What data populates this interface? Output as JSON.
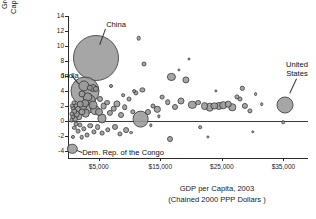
{
  "chart_data": {
    "type": "scatter",
    "title": "",
    "xlabel": "GDP per Capita, 2003 (Chained 2000 PPP Dollars )",
    "xlabel_line1": "GDP per Capita, 2003",
    "xlabel_line2": "(Chained 2000 PPP Dollars )",
    "ylabel": "Growth of Real GDP per Capita, Average 1980-2003 (Percent per Year)",
    "ylabel_line1": "Growth of Real GDP per",
    "ylabel_line2": "Capita, Average 1980-2003",
    "ylabel_line3": "(Percent per Year)",
    "xlim": [
      0,
      39000
    ],
    "ylim": [
      -5,
      14
    ],
    "xticks": [
      5000,
      15000,
      25000,
      35000
    ],
    "xtick_labels": [
      "$5,000",
      "$15,000",
      "$25,000",
      "$35,000"
    ],
    "yticks": [
      -4,
      -2,
      0,
      2,
      4,
      6,
      8,
      10,
      12,
      14
    ],
    "ytick_labels": [
      "-4",
      "-2",
      "0",
      "2",
      "4",
      "6",
      "8",
      "10",
      "12",
      "14"
    ],
    "grid": false,
    "legend": "none",
    "zero_line": 0,
    "size_encodes": "population",
    "annotations": [
      {
        "label": "China",
        "x": 4500,
        "y": 8.4,
        "label_x": 6200,
        "label_y": 12.2
      },
      {
        "label": "India",
        "x": 2800,
        "y": 4.0,
        "label_x": 700,
        "label_y": 6.1
      },
      {
        "label": "Dem. Rep. of the Congo",
        "x": 700,
        "y": -3.8,
        "label_x": 2300,
        "label_y": -4.3
      },
      {
        "label": "United States",
        "x": 35200,
        "y": 2.1,
        "label_x": 37200,
        "label_y": 5.6
      }
    ],
    "points": [
      {
        "x": 4500,
        "y": 8.4,
        "r": 22.0,
        "name": "China"
      },
      {
        "x": 2800,
        "y": 4.0,
        "r": 13.5,
        "name": "India"
      },
      {
        "x": 35200,
        "y": 2.1,
        "r": 7.5,
        "name": "United States"
      },
      {
        "x": 700,
        "y": -3.8,
        "r": 4.2,
        "name": "Dem. Rep. of the Congo"
      },
      {
        "x": 11800,
        "y": 0.2,
        "r": 7.4,
        "name": ""
      },
      {
        "x": 2550,
        "y": 4.6,
        "r": 4.6,
        "name": ""
      },
      {
        "x": 3150,
        "y": 3.2,
        "r": 3.6,
        "name": ""
      },
      {
        "x": 3600,
        "y": 2.7,
        "r": 4.3,
        "name": ""
      },
      {
        "x": 4050,
        "y": 2.1,
        "r": 3.4,
        "name": ""
      },
      {
        "x": 4450,
        "y": 1.4,
        "r": 3.9,
        "name": ""
      },
      {
        "x": 5000,
        "y": 1.1,
        "r": 3.0,
        "name": ""
      },
      {
        "x": 5450,
        "y": 0.3,
        "r": 3.6,
        "name": ""
      },
      {
        "x": 3300,
        "y": 1.6,
        "r": 4.1,
        "name": ""
      },
      {
        "x": 2900,
        "y": 1.0,
        "r": 3.3,
        "name": ""
      },
      {
        "x": 2500,
        "y": 1.8,
        "r": 3.0,
        "name": ""
      },
      {
        "x": 2200,
        "y": 1.2,
        "r": 2.6,
        "name": ""
      },
      {
        "x": 2000,
        "y": 2.2,
        "r": 2.3,
        "name": ""
      },
      {
        "x": 1800,
        "y": 0.6,
        "r": 2.7,
        "name": ""
      },
      {
        "x": 1600,
        "y": 1.6,
        "r": 2.2,
        "name": ""
      },
      {
        "x": 1400,
        "y": 0.9,
        "r": 2.4,
        "name": ""
      },
      {
        "x": 1250,
        "y": 2.0,
        "r": 1.9,
        "name": ""
      },
      {
        "x": 1150,
        "y": 0.2,
        "r": 2.1,
        "name": ""
      },
      {
        "x": 1000,
        "y": 1.3,
        "r": 1.8,
        "name": ""
      },
      {
        "x": 900,
        "y": 2.4,
        "r": 1.6,
        "name": ""
      },
      {
        "x": 820,
        "y": 0.5,
        "r": 1.7,
        "name": ""
      },
      {
        "x": 760,
        "y": 1.7,
        "r": 1.5,
        "name": ""
      },
      {
        "x": 700,
        "y": 0.9,
        "r": 1.6,
        "name": ""
      },
      {
        "x": 640,
        "y": 2.0,
        "r": 1.3,
        "name": ""
      },
      {
        "x": 600,
        "y": 0.1,
        "r": 1.4,
        "name": ""
      },
      {
        "x": 2350,
        "y": 3.6,
        "r": 2.5,
        "name": ""
      },
      {
        "x": 2750,
        "y": 2.3,
        "r": 2.8,
        "name": ""
      },
      {
        "x": 3500,
        "y": 4.4,
        "r": 2.2,
        "name": ""
      },
      {
        "x": 4100,
        "y": 4.3,
        "r": 3.0,
        "name": ""
      },
      {
        "x": 4600,
        "y": 4.2,
        "r": 2.1,
        "name": ""
      },
      {
        "x": 5200,
        "y": 2.9,
        "r": 2.0,
        "name": ""
      },
      {
        "x": 5800,
        "y": 1.9,
        "r": 2.4,
        "name": ""
      },
      {
        "x": 6300,
        "y": 2.4,
        "r": 1.9,
        "name": ""
      },
      {
        "x": 6800,
        "y": 1.0,
        "r": 2.1,
        "name": ""
      },
      {
        "x": 7400,
        "y": 1.6,
        "r": 2.3,
        "name": ""
      },
      {
        "x": 8000,
        "y": 2.2,
        "r": 2.6,
        "name": ""
      },
      {
        "x": 8600,
        "y": 0.7,
        "r": 2.0,
        "name": ""
      },
      {
        "x": 9200,
        "y": 1.8,
        "r": 1.8,
        "name": ""
      },
      {
        "x": 9900,
        "y": 2.9,
        "r": 1.5,
        "name": ""
      },
      {
        "x": 10500,
        "y": 1.2,
        "r": 1.7,
        "name": ""
      },
      {
        "x": 11000,
        "y": 3.7,
        "r": 1.6,
        "name": ""
      },
      {
        "x": 11500,
        "y": 11.0,
        "r": 1.3,
        "name": ""
      },
      {
        "x": 12400,
        "y": 7.6,
        "r": 1.5,
        "name": ""
      },
      {
        "x": 12100,
        "y": 4.1,
        "r": 1.6,
        "name": ""
      },
      {
        "x": 13000,
        "y": 1.1,
        "r": 2.0,
        "name": ""
      },
      {
        "x": 13800,
        "y": 2.0,
        "r": 1.5,
        "name": ""
      },
      {
        "x": 14500,
        "y": 1.5,
        "r": 2.2,
        "name": ""
      },
      {
        "x": 15300,
        "y": 3.1,
        "r": 1.4,
        "name": ""
      },
      {
        "x": 16200,
        "y": 2.5,
        "r": 1.8,
        "name": ""
      },
      {
        "x": 16800,
        "y": 5.8,
        "r": 3.1,
        "name": ""
      },
      {
        "x": 17400,
        "y": 1.8,
        "r": 2.0,
        "name": ""
      },
      {
        "x": 18400,
        "y": 2.6,
        "r": 2.5,
        "name": ""
      },
      {
        "x": 19200,
        "y": 5.5,
        "r": 2.6,
        "name": ""
      },
      {
        "x": 20200,
        "y": 2.1,
        "r": 3.2,
        "name": ""
      },
      {
        "x": 21200,
        "y": 2.4,
        "r": 1.9,
        "name": ""
      },
      {
        "x": 22200,
        "y": 1.9,
        "r": 2.9,
        "name": ""
      },
      {
        "x": 23000,
        "y": 1.8,
        "r": 3.3,
        "name": ""
      },
      {
        "x": 23800,
        "y": 2.0,
        "r": 2.6,
        "name": ""
      },
      {
        "x": 24500,
        "y": 1.9,
        "r": 3.0,
        "name": ""
      },
      {
        "x": 25200,
        "y": 2.1,
        "r": 2.8,
        "name": ""
      },
      {
        "x": 26000,
        "y": 2.2,
        "r": 2.3,
        "name": ""
      },
      {
        "x": 26700,
        "y": 1.8,
        "r": 2.7,
        "name": ""
      },
      {
        "x": 27400,
        "y": 3.2,
        "r": 1.6,
        "name": ""
      },
      {
        "x": 27900,
        "y": 2.9,
        "r": 1.5,
        "name": ""
      },
      {
        "x": 28300,
        "y": 4.3,
        "r": 1.2,
        "name": ""
      },
      {
        "x": 28800,
        "y": 2.0,
        "r": 2.1,
        "name": ""
      },
      {
        "x": 29500,
        "y": 1.3,
        "r": 1.6,
        "name": ""
      },
      {
        "x": 30500,
        "y": 3.5,
        "r": 0.9,
        "name": ""
      },
      {
        "x": 31500,
        "y": 2.2,
        "r": 0.8,
        "name": ""
      },
      {
        "x": 9400,
        "y": -1.3,
        "r": 1.9,
        "name": ""
      },
      {
        "x": 8500,
        "y": -1.8,
        "r": 1.6,
        "name": ""
      },
      {
        "x": 7600,
        "y": -0.8,
        "r": 2.0,
        "name": ""
      },
      {
        "x": 6500,
        "y": -1.2,
        "r": 1.7,
        "name": ""
      },
      {
        "x": 5600,
        "y": -1.7,
        "r": 1.4,
        "name": ""
      },
      {
        "x": 4800,
        "y": -0.9,
        "r": 1.9,
        "name": ""
      },
      {
        "x": 4200,
        "y": -1.5,
        "r": 1.6,
        "name": ""
      },
      {
        "x": 3600,
        "y": -0.7,
        "r": 1.8,
        "name": ""
      },
      {
        "x": 3100,
        "y": -1.9,
        "r": 1.5,
        "name": ""
      },
      {
        "x": 2600,
        "y": -1.1,
        "r": 1.7,
        "name": ""
      },
      {
        "x": 2200,
        "y": -2.2,
        "r": 1.3,
        "name": ""
      },
      {
        "x": 1900,
        "y": -0.6,
        "r": 1.6,
        "name": ""
      },
      {
        "x": 1600,
        "y": -1.4,
        "r": 1.4,
        "name": ""
      },
      {
        "x": 1300,
        "y": -0.4,
        "r": 1.5,
        "name": ""
      },
      {
        "x": 1050,
        "y": -1.0,
        "r": 1.2,
        "name": ""
      },
      {
        "x": 850,
        "y": -2.2,
        "r": 1.1,
        "name": ""
      },
      {
        "x": 10200,
        "y": -1.6,
        "r": 0.9,
        "name": ""
      },
      {
        "x": 16500,
        "y": -2.5,
        "r": 2.0,
        "name": ""
      },
      {
        "x": 21500,
        "y": -0.9,
        "r": 0.8,
        "name": ""
      },
      {
        "x": 22800,
        "y": -2.2,
        "r": 0.6,
        "name": ""
      },
      {
        "x": 30000,
        "y": -1.5,
        "r": 0.7,
        "name": ""
      },
      {
        "x": 35000,
        "y": -0.2,
        "r": 0.8,
        "name": ""
      },
      {
        "x": 13500,
        "y": -0.6,
        "r": 0.7,
        "name": ""
      },
      {
        "x": 14800,
        "y": 0.6,
        "r": 0.7,
        "name": ""
      },
      {
        "x": 18000,
        "y": 6.8,
        "r": 0.6,
        "name": ""
      },
      {
        "x": 19600,
        "y": 8.2,
        "r": 0.5,
        "name": ""
      },
      {
        "x": 24000,
        "y": 4.0,
        "r": 0.6,
        "name": ""
      },
      {
        "x": 7000,
        "y": 4.7,
        "r": 1.0,
        "name": ""
      },
      {
        "x": 9000,
        "y": 3.4,
        "r": 0.8,
        "name": ""
      },
      {
        "x": 10800,
        "y": 4.0,
        "r": 0.9,
        "name": ""
      }
    ]
  }
}
